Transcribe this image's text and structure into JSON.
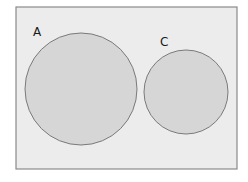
{
  "diagram": {
    "type": "venn",
    "frame": {
      "x": 16,
      "y": 7,
      "width": 221,
      "height": 162,
      "fill": "#ececec",
      "stroke": "#8a8a8a"
    },
    "sets": [
      {
        "label": "A",
        "cx": 81,
        "cy": 89,
        "r": 56,
        "label_x": 33,
        "label_y": 36,
        "fill": "#d6d6d6",
        "stroke": "#7a7a7a"
      },
      {
        "label": "C",
        "cx": 186,
        "cy": 92,
        "r": 42,
        "label_x": 160,
        "label_y": 46,
        "fill": "#d6d6d6",
        "stroke": "#7a7a7a"
      }
    ]
  }
}
